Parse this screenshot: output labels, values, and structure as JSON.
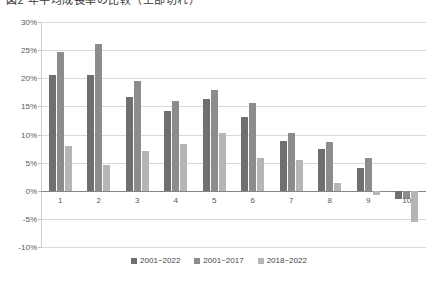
{
  "title": {
    "text": "図2 年平均成長率の比較（上部切れ）",
    "visible_partial": true
  },
  "chart_data": {
    "type": "bar",
    "title": "",
    "xlabel": "",
    "ylabel": "",
    "categories": [
      "1",
      "2",
      "3",
      "4",
      "5",
      "6",
      "7",
      "8",
      "9",
      "10"
    ],
    "series": [
      {
        "name": "2001~2022",
        "color": "#6f6f6f",
        "values": [
          20.6,
          20.6,
          16.6,
          14.2,
          16.4,
          13.1,
          8.8,
          7.5,
          4.0,
          -1.5
        ]
      },
      {
        "name": "2001~2017",
        "color": "#8c8c8c",
        "values": [
          24.7,
          26.1,
          19.5,
          16.0,
          18.0,
          15.6,
          10.2,
          8.6,
          5.9,
          -1.5
        ]
      },
      {
        "name": "2018~2022",
        "color": "#b5b5b5",
        "values": [
          7.9,
          4.5,
          7.1,
          8.4,
          10.2,
          5.9,
          5.4,
          1.4,
          -0.8,
          -5.5
        ]
      }
    ],
    "ylim": [
      -10,
      30
    ],
    "ytick_step": 5,
    "ytick_labels": [
      "30%",
      "25%",
      "20%",
      "15%",
      "10%",
      "5%",
      "0%",
      "-5%",
      "-10%"
    ],
    "ytick_values": [
      30,
      25,
      20,
      15,
      10,
      5,
      0,
      -5,
      -10
    ],
    "grid": true,
    "legend_position": "bottom"
  },
  "colors": {
    "gridline": "#d9d9d9",
    "zero_line": "#868686",
    "axis": "#d0d0d0",
    "tick_text": "#595959",
    "legend_text": "#444444",
    "background": "#ffffff"
  }
}
